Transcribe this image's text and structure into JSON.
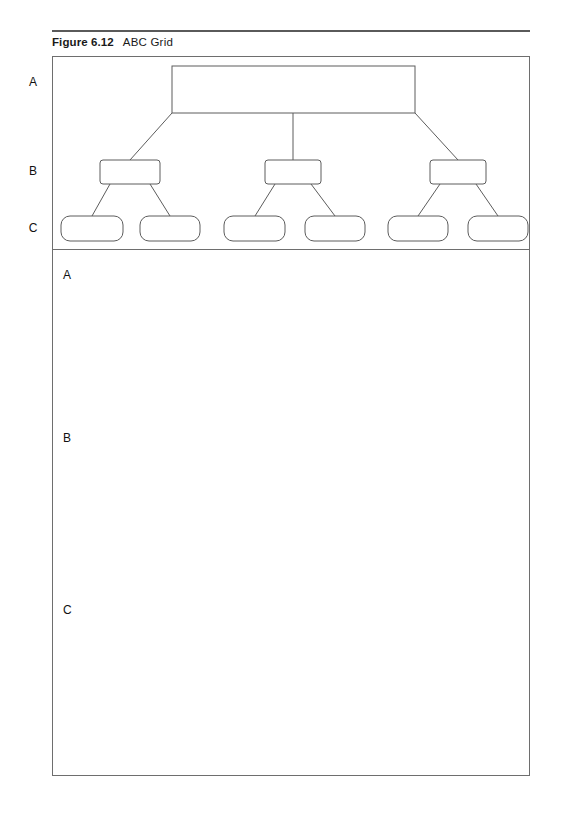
{
  "figure": {
    "label": "Figure 6.12",
    "title": "ABC Grid"
  },
  "axis_labels": {
    "a": "A",
    "b": "B",
    "c": "C"
  },
  "worksheet_rows": {
    "a": "A",
    "b": "B",
    "c": "C"
  },
  "colors": {
    "rule": "#5a5a5a",
    "panel_border": "#6e6e6e",
    "node_stroke": "#5c5c5c",
    "node_fill": "#ffffff",
    "text": "#111111"
  },
  "diagram": {
    "type": "hierarchy-tree",
    "levels": [
      "A",
      "B",
      "C"
    ],
    "nodes": {
      "level_a": [
        {
          "id": "a1",
          "label": "",
          "shape": "rectangle",
          "x": 120,
          "y": 10,
          "w": 243,
          "h": 47
        }
      ],
      "level_b": [
        {
          "id": "b1",
          "label": "",
          "shape": "rounded-rectangle",
          "x": 48,
          "y": 104,
          "w": 60,
          "h": 24
        },
        {
          "id": "b2",
          "label": "",
          "shape": "rounded-rectangle",
          "x": 213,
          "y": 104,
          "w": 56,
          "h": 24
        },
        {
          "id": "b3",
          "label": "",
          "shape": "rounded-rectangle",
          "x": 378,
          "y": 104,
          "w": 56,
          "h": 24
        }
      ],
      "level_c": [
        {
          "id": "c1",
          "label": "",
          "shape": "pill",
          "x": 9,
          "y": 160,
          "w": 62,
          "h": 25
        },
        {
          "id": "c2",
          "label": "",
          "shape": "pill",
          "x": 88,
          "y": 160,
          "w": 60,
          "h": 25
        },
        {
          "id": "c3",
          "label": "",
          "shape": "pill",
          "x": 172,
          "y": 160,
          "w": 61,
          "h": 25
        },
        {
          "id": "c4",
          "label": "",
          "shape": "pill",
          "x": 253,
          "y": 160,
          "w": 60,
          "h": 25
        },
        {
          "id": "c5",
          "label": "",
          "shape": "pill",
          "x": 336,
          "y": 160,
          "w": 60,
          "h": 25
        },
        {
          "id": "c6",
          "label": "",
          "shape": "pill",
          "x": 416,
          "y": 160,
          "w": 60,
          "h": 25
        }
      ]
    },
    "edges": [
      {
        "from": "a1",
        "to": "b1"
      },
      {
        "from": "a1",
        "to": "b2"
      },
      {
        "from": "a1",
        "to": "b3"
      },
      {
        "from": "b1",
        "to": "c1"
      },
      {
        "from": "b1",
        "to": "c2"
      },
      {
        "from": "b2",
        "to": "c3"
      },
      {
        "from": "b2",
        "to": "c4"
      },
      {
        "from": "b3",
        "to": "c5"
      },
      {
        "from": "b3",
        "to": "c6"
      }
    ]
  }
}
